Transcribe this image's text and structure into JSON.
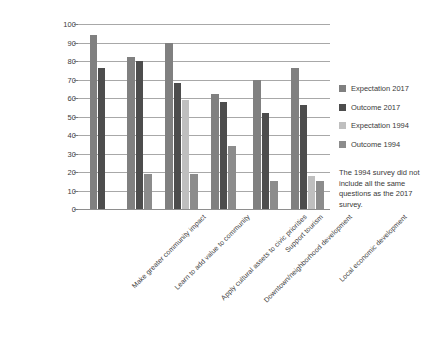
{
  "chart_data": {
    "type": "bar",
    "title": "",
    "xlabel": "",
    "ylabel": "",
    "ylim": [
      0,
      100
    ],
    "ytick_step": 10,
    "grid": true,
    "legend_position": "right",
    "categories": [
      "Make greater community impact",
      "Learn to add value to community",
      "Apply cultural assets to civic priorities",
      "Downtown/neighborhood development",
      "Support tourism",
      "Local economic development"
    ],
    "series": [
      {
        "name": "Expectation 2017",
        "color": "#808080",
        "values": [
          94,
          82,
          90,
          62,
          70,
          76
        ]
      },
      {
        "name": "Outcome 2017",
        "color": "#4d4d4d",
        "values": [
          76,
          80,
          68,
          58,
          52,
          56
        ]
      },
      {
        "name": "Expectation 1994",
        "color": "#bfbfbf",
        "values": [
          null,
          null,
          59,
          null,
          null,
          18
        ]
      },
      {
        "name": "Outcome 1994",
        "color": "#8c8c8c",
        "values": [
          null,
          19,
          19,
          34,
          15,
          15
        ]
      }
    ],
    "ytick_labels": [
      "100",
      "90",
      "80",
      "70",
      "60",
      "50",
      "40",
      "30",
      "20",
      "10",
      "0"
    ],
    "annotations": [
      "The 1994 survey did not include all the same questions as the 2017 survey."
    ]
  },
  "legend": {
    "items": [
      {
        "label": "Expectation 2017",
        "color": "#808080"
      },
      {
        "label": "Outcome 2017",
        "color": "#4d4d4d"
      },
      {
        "label": "Expectation 1994",
        "color": "#bfbfbf"
      },
      {
        "label": "Outcome 1994",
        "color": "#8c8c8c"
      }
    ]
  },
  "note": {
    "text": "The 1994 survey did not include all the same questions as the 2017 survey."
  }
}
